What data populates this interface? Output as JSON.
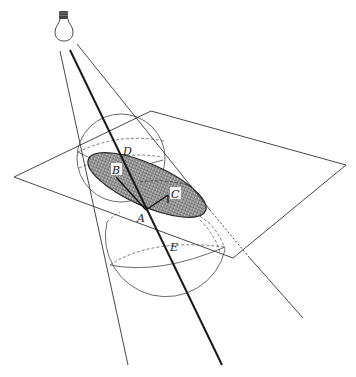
{
  "figure": {
    "colors": {
      "line": "#333333",
      "thick_line": "#1a1a1a",
      "ellipse_fill": "#8a8a8a",
      "background": "#ffffff"
    },
    "icons": [
      "light-bulb-icon"
    ],
    "labels": {
      "D": "D",
      "B": "B",
      "C": "C",
      "A": "A",
      "E": "E"
    }
  }
}
